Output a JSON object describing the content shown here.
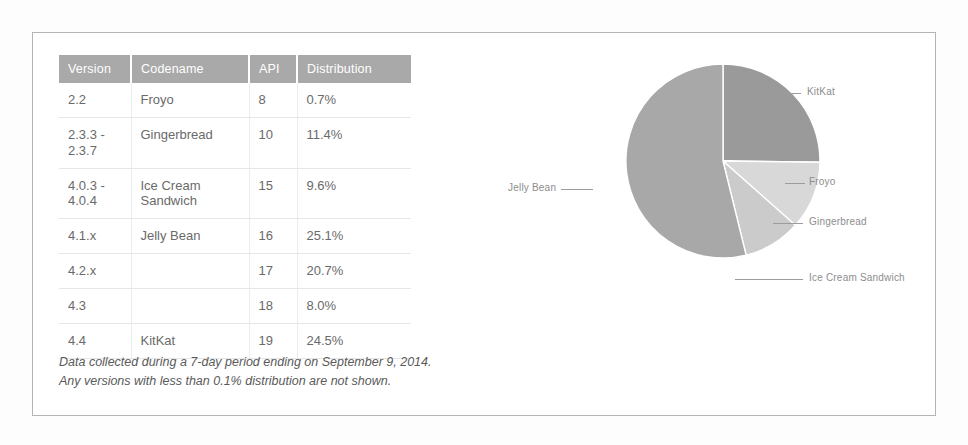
{
  "table": {
    "headers": [
      "Version",
      "Codename",
      "API",
      "Distribution"
    ],
    "rows": [
      {
        "version": "2.2",
        "codename": "Froyo",
        "api": "8",
        "distribution": "0.7%"
      },
      {
        "version": "2.3.3 - 2.3.7",
        "codename": "Gingerbread",
        "api": "10",
        "distribution": "11.4%"
      },
      {
        "version": "4.0.3 - 4.0.4",
        "codename": "Ice Cream Sandwich",
        "api": "15",
        "distribution": "9.6%"
      },
      {
        "version": "4.1.x",
        "codename": "Jelly Bean",
        "api": "16",
        "distribution": "25.1%"
      },
      {
        "version": "4.2.x",
        "codename": "",
        "api": "17",
        "distribution": "20.7%"
      },
      {
        "version": "4.3",
        "codename": "",
        "api": "18",
        "distribution": "8.0%"
      },
      {
        "version": "4.4",
        "codename": "KitKat",
        "api": "19",
        "distribution": "24.5%"
      }
    ]
  },
  "footnote": {
    "line1": "Data collected during a 7-day period ending on September 9, 2014.",
    "line2": "Any versions with less than 0.1% distribution are not shown."
  },
  "chart_data": {
    "type": "pie",
    "title": "",
    "legend_position": "callout-labels",
    "unit": "%",
    "categories": [
      "KitKat",
      "Froyo",
      "Gingerbread",
      "Ice Cream Sandwich",
      "Jelly Bean"
    ],
    "values": [
      24.5,
      0.7,
      11.4,
      9.6,
      53.8
    ],
    "labels": [
      "KitKat",
      "Froyo",
      "Gingerbread",
      "Ice Cream Sandwich",
      "Jelly Bean"
    ],
    "colors": [
      "#9a9a9a",
      "#e2e2e2",
      "#d8d8d8",
      "#cbcbcb",
      "#a8a8a8"
    ],
    "slice_border_color": "#ffffff",
    "start_angle_deg": 0,
    "direction": "clockwise"
  },
  "colors": {
    "header_bg": "#a9a9a9",
    "header_text": "#ffffff",
    "body_text": "#5d5d5d",
    "version_text": "#9b9b9b",
    "frame_border": "#b4b4b4",
    "grid_line": "#e6e6e6",
    "label_text": "#8d8d8d"
  }
}
